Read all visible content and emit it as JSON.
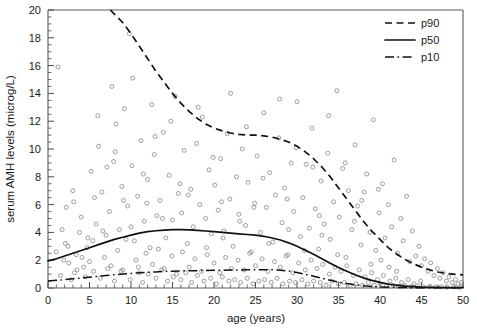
{
  "chart_data": {
    "type": "scatter",
    "title": "",
    "xlabel": "age (years)",
    "ylabel": "serum AMH levels (microg/L)",
    "xlim": [
      0,
      50
    ],
    "ylim": [
      0,
      20
    ],
    "xticks": [
      0,
      5,
      10,
      15,
      20,
      25,
      30,
      35,
      40,
      45,
      50
    ],
    "xtick_labels": [
      "0",
      "5",
      "10",
      "15",
      "20",
      "25",
      "30",
      "35",
      "40",
      "45",
      "50"
    ],
    "x_minor_tick_step": 1,
    "yticks": [
      0,
      2,
      4,
      6,
      8,
      10,
      12,
      14,
      16,
      18,
      20
    ],
    "ytick_labels": [
      "0",
      "2",
      "4",
      "6",
      "8",
      "10",
      "12",
      "14",
      "16",
      "18",
      "20"
    ],
    "y_minor_tick_step": 0.5,
    "grid": false,
    "legend_position": "top-right",
    "marker": "open-circle",
    "marker_color": "#8c8c8c",
    "curve_color": "#111111",
    "legend": [
      {
        "name": "p90",
        "style": "dashed"
      },
      {
        "name": "p50",
        "style": "solid"
      },
      {
        "name": "p10",
        "style": "dash-dot"
      }
    ],
    "series": [
      {
        "name": "p90",
        "style": "dashed",
        "x": [
          7.5,
          9,
          10,
          11,
          12,
          13,
          14,
          15,
          16,
          17,
          18,
          19,
          20,
          21,
          22,
          23,
          24,
          25,
          26,
          27,
          28,
          29,
          30,
          31,
          32,
          33,
          34,
          35,
          36,
          37,
          38,
          39,
          40,
          41,
          42,
          43,
          44,
          45,
          46,
          47,
          48,
          49,
          50
        ],
        "y": [
          20.0,
          19.1,
          18.3,
          17.4,
          16.5,
          15.6,
          14.8,
          14.0,
          13.3,
          12.7,
          12.2,
          11.8,
          11.5,
          11.3,
          11.15,
          11.05,
          11.0,
          11.0,
          10.95,
          10.85,
          10.7,
          10.5,
          10.2,
          9.8,
          9.3,
          8.7,
          8.0,
          7.2,
          6.4,
          5.6,
          4.8,
          4.1,
          3.5,
          2.9,
          2.45,
          2.05,
          1.75,
          1.5,
          1.3,
          1.15,
          1.05,
          0.98,
          0.95
        ]
      },
      {
        "name": "p50",
        "style": "solid",
        "x": [
          0,
          1,
          2,
          3,
          4,
          5,
          6,
          7,
          8,
          9,
          10,
          11,
          12,
          13,
          14,
          15,
          16,
          17,
          18,
          19,
          20,
          21,
          22,
          23,
          24,
          25,
          26,
          27,
          28,
          29,
          30,
          31,
          32,
          33,
          34,
          35,
          36,
          37,
          38,
          39,
          40,
          41,
          42,
          43,
          44,
          45,
          46,
          47,
          48,
          49,
          50
        ],
        "y": [
          1.95,
          2.1,
          2.3,
          2.5,
          2.7,
          2.9,
          3.1,
          3.3,
          3.5,
          3.65,
          3.8,
          3.95,
          4.05,
          4.12,
          4.17,
          4.2,
          4.2,
          4.18,
          4.15,
          4.1,
          4.05,
          4.0,
          3.95,
          3.9,
          3.85,
          3.8,
          3.72,
          3.6,
          3.45,
          3.25,
          3.0,
          2.72,
          2.42,
          2.1,
          1.78,
          1.48,
          1.2,
          0.95,
          0.73,
          0.55,
          0.4,
          0.28,
          0.2,
          0.14,
          0.1,
          0.07,
          0.05,
          0.04,
          0.03,
          0.02,
          0.02
        ]
      },
      {
        "name": "p10",
        "style": "dash-dot",
        "x": [
          0,
          1,
          2,
          3,
          4,
          5,
          6,
          7,
          8,
          9,
          10,
          11,
          12,
          13,
          14,
          15,
          16,
          17,
          18,
          19,
          20,
          21,
          22,
          23,
          24,
          25,
          26,
          27,
          28,
          29,
          30,
          31,
          32,
          33,
          34,
          35,
          36,
          37,
          38,
          39,
          40,
          41,
          42,
          43,
          44,
          45,
          46,
          47,
          48,
          49,
          50
        ],
        "y": [
          0.5,
          0.55,
          0.6,
          0.66,
          0.72,
          0.78,
          0.84,
          0.9,
          0.96,
          1.0,
          1.05,
          1.09,
          1.13,
          1.16,
          1.19,
          1.21,
          1.23,
          1.24,
          1.25,
          1.26,
          1.27,
          1.28,
          1.29,
          1.3,
          1.31,
          1.32,
          1.32,
          1.31,
          1.28,
          1.22,
          1.12,
          0.99,
          0.85,
          0.7,
          0.56,
          0.43,
          0.32,
          0.23,
          0.16,
          0.11,
          0.08,
          0.06,
          0.04,
          0.03,
          0.025,
          0.02,
          0.02,
          0.015,
          0.015,
          0.01,
          0.01
        ]
      }
    ],
    "scatter_points": [
      [
        1.2,
        15.9
      ],
      [
        9.8,
        18.3
      ],
      [
        12.5,
        13.2
      ],
      [
        3.1,
        6.2
      ],
      [
        4.0,
        5.1
      ],
      [
        5.2,
        8.4
      ],
      [
        5.8,
        4.6
      ],
      [
        6.1,
        10.2
      ],
      [
        6.5,
        6.9
      ],
      [
        7.0,
        3.8
      ],
      [
        7.4,
        5.5
      ],
      [
        7.9,
        9.1
      ],
      [
        8.2,
        11.8
      ],
      [
        8.6,
        4.2
      ],
      [
        8.9,
        7.3
      ],
      [
        9.2,
        12.9
      ],
      [
        9.6,
        5.9
      ],
      [
        10.1,
        8.8
      ],
      [
        10.4,
        3.4
      ],
      [
        10.8,
        6.6
      ],
      [
        11.2,
        10.6
      ],
      [
        11.6,
        4.8
      ],
      [
        12.0,
        7.8
      ],
      [
        12.3,
        2.9
      ],
      [
        12.8,
        9.6
      ],
      [
        13.1,
        5.2
      ],
      [
        13.5,
        6.3
      ],
      [
        13.9,
        11.2
      ],
      [
        14.2,
        3.6
      ],
      [
        14.6,
        8.1
      ],
      [
        15.0,
        4.9
      ],
      [
        15.3,
        13.8
      ],
      [
        15.7,
        6.8
      ],
      [
        16.1,
        5.4
      ],
      [
        16.4,
        9.9
      ],
      [
        16.8,
        3.2
      ],
      [
        17.2,
        7.1
      ],
      [
        17.5,
        4.4
      ],
      [
        17.9,
        10.4
      ],
      [
        18.3,
        6.0
      ],
      [
        18.6,
        12.3
      ],
      [
        19.0,
        5.0
      ],
      [
        19.4,
        8.5
      ],
      [
        19.7,
        3.9
      ],
      [
        20.1,
        7.4
      ],
      [
        20.5,
        5.6
      ],
      [
        20.8,
        9.3
      ],
      [
        21.2,
        4.1
      ],
      [
        21.6,
        11.1
      ],
      [
        21.9,
        6.4
      ],
      [
        22.3,
        3.0
      ],
      [
        22.7,
        8.0
      ],
      [
        23.0,
        5.3
      ],
      [
        23.4,
        10.0
      ],
      [
        23.8,
        4.5
      ],
      [
        24.1,
        7.6
      ],
      [
        24.5,
        2.6
      ],
      [
        24.9,
        6.1
      ],
      [
        25.2,
        9.5
      ],
      [
        25.6,
        4.0
      ],
      [
        26.0,
        12.6
      ],
      [
        26.3,
        5.8
      ],
      [
        26.7,
        8.3
      ],
      [
        27.1,
        3.3
      ],
      [
        27.4,
        6.7
      ],
      [
        27.8,
        10.8
      ],
      [
        28.2,
        4.7
      ],
      [
        28.5,
        7.2
      ],
      [
        28.9,
        2.4
      ],
      [
        29.3,
        9.0
      ],
      [
        29.6,
        5.5
      ],
      [
        30.0,
        13.4
      ],
      [
        30.4,
        3.7
      ],
      [
        30.7,
        6.5
      ],
      [
        31.1,
        8.9
      ],
      [
        31.5,
        4.3
      ],
      [
        31.8,
        11.5
      ],
      [
        32.2,
        5.7
      ],
      [
        32.6,
        2.8
      ],
      [
        32.9,
        7.7
      ],
      [
        33.3,
        4.6
      ],
      [
        33.7,
        9.7
      ],
      [
        34.0,
        3.5
      ],
      [
        34.4,
        6.2
      ],
      [
        34.8,
        14.2
      ],
      [
        35.1,
        5.1
      ],
      [
        35.5,
        8.6
      ],
      [
        35.9,
        2.2
      ],
      [
        36.2,
        7.0
      ],
      [
        36.6,
        4.2
      ],
      [
        37.0,
        10.3
      ],
      [
        37.3,
        5.9
      ],
      [
        37.7,
        3.1
      ],
      [
        38.1,
        6.9
      ],
      [
        38.4,
        8.2
      ],
      [
        38.8,
        4.0
      ],
      [
        39.2,
        12.1
      ],
      [
        39.5,
        2.7
      ],
      [
        39.9,
        5.4
      ],
      [
        40.3,
        7.5
      ],
      [
        40.6,
        3.6
      ],
      [
        41.0,
        6.0
      ],
      [
        41.4,
        4.4
      ],
      [
        41.7,
        9.2
      ],
      [
        42.1,
        2.5
      ],
      [
        42.5,
        5.0
      ],
      [
        42.8,
        3.4
      ],
      [
        43.2,
        6.6
      ],
      [
        43.6,
        1.9
      ],
      [
        43.9,
        4.1
      ],
      [
        44.3,
        2.3
      ],
      [
        44.7,
        3.0
      ],
      [
        45.0,
        1.6
      ],
      [
        45.4,
        2.1
      ],
      [
        45.8,
        1.2
      ],
      [
        46.1,
        1.8
      ],
      [
        46.5,
        0.9
      ],
      [
        46.9,
        1.4
      ],
      [
        47.2,
        0.7
      ],
      [
        47.6,
        1.1
      ],
      [
        48.0,
        0.5
      ],
      [
        48.3,
        0.8
      ],
      [
        48.7,
        0.4
      ],
      [
        49.1,
        0.6
      ],
      [
        49.4,
        0.3
      ],
      [
        49.8,
        0.4
      ],
      [
        2.1,
        3.2
      ],
      [
        2.5,
        1.8
      ],
      [
        3.4,
        2.4
      ],
      [
        3.8,
        4.0
      ],
      [
        4.3,
        1.5
      ],
      [
        4.7,
        2.9
      ],
      [
        5.5,
        1.2
      ],
      [
        6.8,
        2.2
      ],
      [
        7.6,
        1.6
      ],
      [
        8.4,
        2.7
      ],
      [
        9.0,
        1.3
      ],
      [
        9.4,
        3.5
      ],
      [
        10.6,
        2.0
      ],
      [
        11.0,
        1.1
      ],
      [
        11.8,
        2.5
      ],
      [
        12.6,
        1.7
      ],
      [
        13.3,
        2.8
      ],
      [
        14.0,
        1.4
      ],
      [
        14.9,
        2.3
      ],
      [
        15.5,
        1.0
      ],
      [
        16.2,
        2.6
      ],
      [
        17.0,
        1.5
      ],
      [
        17.7,
        2.1
      ],
      [
        18.5,
        1.2
      ],
      [
        19.2,
        2.4
      ],
      [
        20.0,
        1.8
      ],
      [
        20.7,
        1.1
      ],
      [
        21.4,
        2.2
      ],
      [
        22.1,
        1.4
      ],
      [
        22.9,
        2.0
      ],
      [
        23.6,
        1.3
      ],
      [
        24.3,
        2.5
      ],
      [
        25.0,
        1.6
      ],
      [
        25.8,
        2.1
      ],
      [
        26.5,
        1.2
      ],
      [
        27.3,
        1.9
      ],
      [
        28.0,
        1.5
      ],
      [
        28.7,
        2.3
      ],
      [
        29.5,
        1.1
      ],
      [
        30.2,
        1.8
      ],
      [
        31.0,
        1.3
      ],
      [
        31.7,
        2.0
      ],
      [
        32.4,
        1.4
      ],
      [
        33.1,
        1.7
      ],
      [
        33.9,
        1.0
      ],
      [
        34.6,
        1.5
      ],
      [
        35.3,
        1.2
      ],
      [
        36.0,
        1.6
      ],
      [
        36.8,
        0.9
      ],
      [
        37.5,
        1.3
      ],
      [
        38.2,
        0.8
      ],
      [
        39.0,
        1.1
      ],
      [
        39.7,
        0.6
      ],
      [
        40.4,
        0.9
      ],
      [
        41.2,
        0.5
      ],
      [
        41.9,
        0.7
      ],
      [
        42.6,
        0.4
      ],
      [
        43.4,
        0.6
      ],
      [
        44.1,
        0.3
      ],
      [
        44.9,
        0.5
      ],
      [
        1.5,
        0.9
      ],
      [
        1.9,
        2.0
      ],
      [
        2.8,
        0.6
      ],
      [
        3.5,
        1.3
      ],
      [
        4.5,
        0.8
      ],
      [
        5.0,
        1.9
      ],
      [
        6.3,
        0.7
      ],
      [
        7.2,
        1.4
      ],
      [
        8.0,
        0.5
      ],
      [
        8.8,
        1.2
      ],
      [
        9.9,
        0.6
      ],
      [
        10.9,
        1.5
      ],
      [
        11.4,
        0.4
      ],
      [
        12.1,
        1.0
      ],
      [
        13.0,
        0.7
      ],
      [
        13.7,
        1.3
      ],
      [
        14.4,
        0.5
      ],
      [
        15.1,
        0.8
      ],
      [
        16.0,
        0.6
      ],
      [
        16.6,
        1.1
      ],
      [
        17.3,
        0.4
      ],
      [
        18.0,
        0.9
      ],
      [
        18.8,
        0.5
      ],
      [
        19.6,
        0.7
      ],
      [
        20.3,
        0.3
      ],
      [
        21.0,
        0.8
      ],
      [
        21.8,
        0.5
      ],
      [
        22.5,
        0.6
      ],
      [
        23.2,
        0.4
      ],
      [
        24.0,
        0.7
      ],
      [
        24.7,
        0.3
      ],
      [
        25.4,
        0.5
      ],
      [
        26.1,
        0.6
      ],
      [
        26.9,
        0.4
      ],
      [
        27.6,
        0.7
      ],
      [
        28.3,
        0.3
      ],
      [
        29.1,
        0.5
      ],
      [
        29.8,
        0.4
      ],
      [
        30.6,
        0.6
      ],
      [
        31.3,
        0.3
      ],
      [
        32.0,
        0.5
      ],
      [
        32.8,
        0.4
      ],
      [
        33.5,
        0.2
      ],
      [
        34.2,
        0.5
      ],
      [
        35.0,
        0.3
      ],
      [
        35.7,
        0.4
      ],
      [
        36.4,
        0.2
      ],
      [
        37.1,
        0.3
      ],
      [
        37.9,
        0.2
      ],
      [
        38.6,
        0.4
      ],
      [
        39.3,
        0.2
      ],
      [
        40.0,
        0.3
      ],
      [
        40.8,
        0.15
      ],
      [
        41.6,
        0.2
      ],
      [
        42.3,
        0.12
      ],
      [
        43.0,
        0.18
      ],
      [
        43.8,
        0.1
      ],
      [
        44.5,
        0.15
      ],
      [
        45.2,
        0.1
      ],
      [
        46.0,
        0.12
      ],
      [
        46.7,
        0.08
      ],
      [
        47.4,
        0.1
      ],
      [
        48.1,
        0.06
      ],
      [
        48.9,
        0.08
      ],
      [
        49.6,
        0.05
      ],
      [
        6.0,
        12.4
      ],
      [
        7.7,
        14.5
      ],
      [
        8.1,
        9.8
      ],
      [
        10.2,
        15.1
      ],
      [
        11.5,
        8.2
      ],
      [
        12.9,
        10.9
      ],
      [
        14.8,
        12.0
      ],
      [
        15.9,
        7.5
      ],
      [
        18.1,
        13.0
      ],
      [
        19.9,
        9.4
      ],
      [
        22.0,
        14.0
      ],
      [
        23.9,
        11.6
      ],
      [
        25.9,
        7.9
      ],
      [
        27.9,
        13.6
      ],
      [
        29.9,
        10.1
      ],
      [
        31.9,
        8.7
      ],
      [
        33.8,
        12.4
      ],
      [
        35.8,
        9.0
      ],
      [
        37.8,
        6.3
      ],
      [
        39.8,
        7.1
      ],
      [
        2.2,
        5.8
      ],
      [
        3.0,
        7.0
      ],
      [
        4.8,
        3.6
      ],
      [
        5.6,
        6.5
      ],
      [
        6.6,
        4.1
      ],
      [
        7.1,
        8.7
      ],
      [
        9.1,
        6.3
      ],
      [
        10.0,
        4.4
      ],
      [
        11.9,
        6.1
      ],
      [
        13.8,
        5.0
      ],
      [
        16.9,
        6.7
      ],
      [
        20.9,
        6.2
      ],
      [
        24.8,
        5.8
      ],
      [
        28.8,
        6.4
      ],
      [
        32.7,
        5.2
      ],
      [
        36.9,
        4.8
      ],
      [
        1.0,
        2.6
      ],
      [
        1.7,
        4.2
      ],
      [
        2.4,
        3.0
      ],
      [
        3.2,
        1.1
      ],
      [
        4.1,
        2.2
      ],
      [
        5.4,
        3.4
      ],
      [
        19.1,
        2.9
      ],
      [
        26.6,
        3.2
      ],
      [
        30.9,
        2.7
      ],
      [
        34.9,
        2.4
      ],
      [
        38.9,
        1.7
      ],
      [
        42.0,
        1.2
      ],
      [
        21.1,
        3.6
      ],
      [
        23.1,
        4.8
      ],
      [
        29.0,
        4.2
      ],
      [
        33.0,
        3.8
      ],
      [
        40.1,
        2.0
      ],
      [
        41.1,
        1.5
      ]
    ]
  }
}
